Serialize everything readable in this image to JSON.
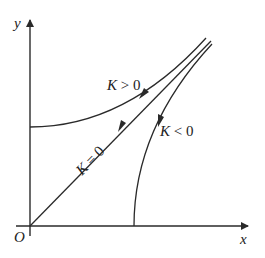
{
  "diagram": {
    "axes": {
      "x_label": "x",
      "y_label": "y",
      "origin_label": "O"
    },
    "curves": [
      {
        "id": "k-positive",
        "label_var": "K",
        "label_rel": " > 0",
        "description": "curve starting on y-axis, bending upward toward upper right, arrow pointing toward y-axis"
      },
      {
        "id": "k-zero",
        "label_var": "K",
        "label_rel": " = 0",
        "description": "straight line through origin, arrow pointing toward origin"
      },
      {
        "id": "k-negative",
        "label_var": "K",
        "label_rel": " < 0",
        "description": "curve starting on x-axis, bending upward toward upper right, arrow pointing toward x-axis"
      }
    ],
    "colors": {
      "stroke": "#2a2a2a",
      "background": "#ffffff"
    }
  }
}
